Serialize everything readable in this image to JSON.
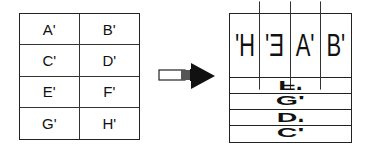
{
  "left_grid": {
    "cells": [
      "A'",
      "B'",
      "C'",
      "D'",
      "E'",
      "F'",
      "G'",
      "H'"
    ]
  },
  "arrow": {
    "direction": "right"
  },
  "right_grid": {
    "top_cells": [
      {
        "label": "H'",
        "orientation": "mirrored"
      },
      {
        "label": "E'",
        "orientation": "mirrored"
      },
      {
        "label": "A'",
        "orientation": "normal"
      },
      {
        "label": "B'",
        "orientation": "normal"
      }
    ],
    "strips": [
      {
        "label": "F'",
        "orientation": "flipped-vertical"
      },
      {
        "label": "G'",
        "orientation": "normal"
      },
      {
        "label": "D'",
        "orientation": "flipped-vertical"
      },
      {
        "label": "C'",
        "orientation": "normal"
      }
    ]
  }
}
